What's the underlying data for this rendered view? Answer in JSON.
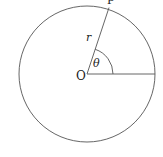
{
  "diagram": {
    "type": "polar-coordinates-circle",
    "colors": {
      "stroke": "#555555",
      "text": "#222222"
    },
    "circle": {
      "cx": 87,
      "cy": 74,
      "r": 68
    },
    "center": {
      "label": "O",
      "x": 87,
      "y": 74
    },
    "point": {
      "label": "P"
    },
    "radius_label": "r",
    "angle_label": "θ"
  }
}
